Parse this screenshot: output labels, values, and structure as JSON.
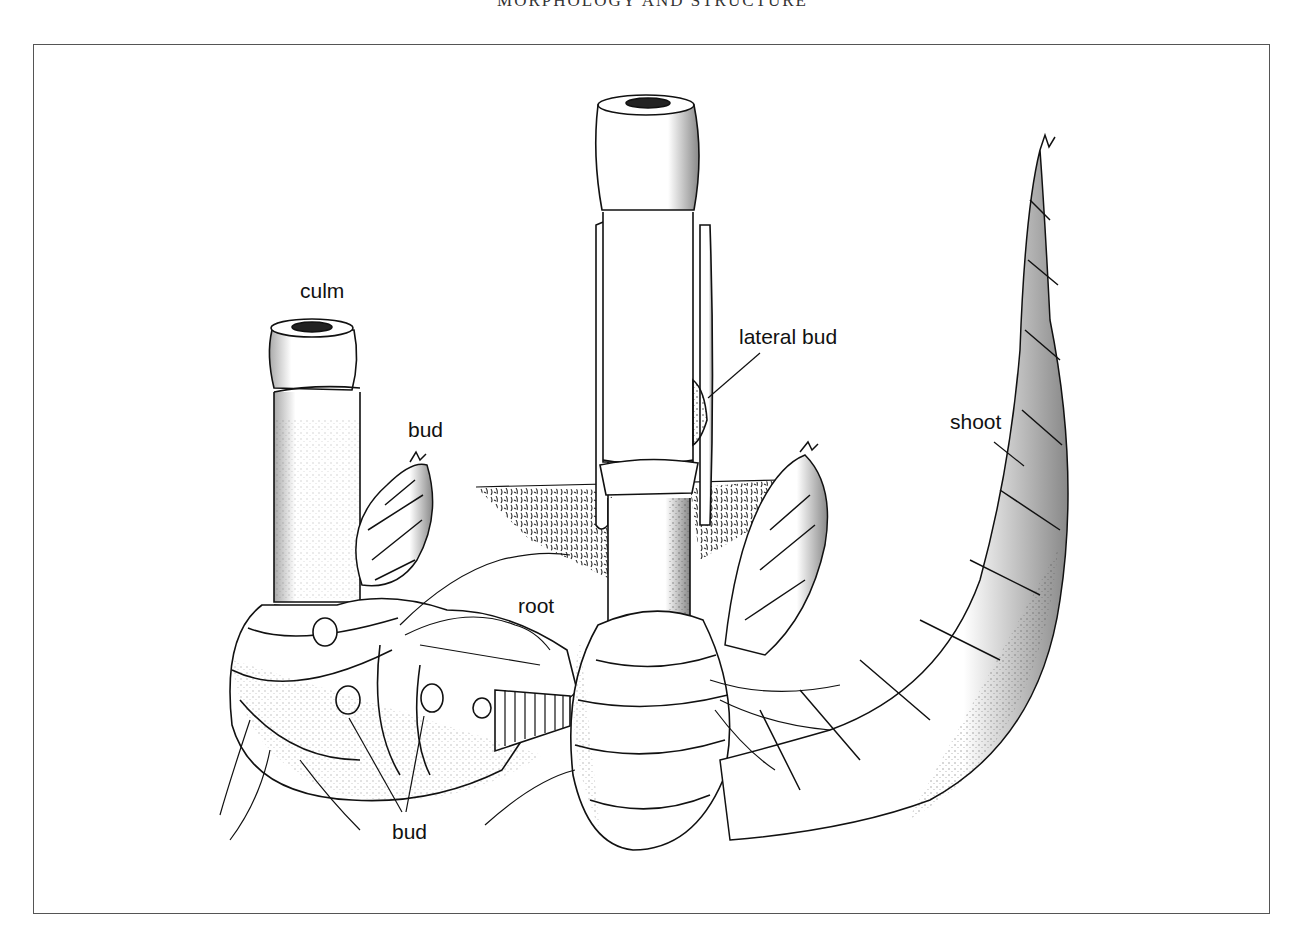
{
  "page": {
    "running_head": "MORPHOLOGY AND STRUCTURE"
  },
  "figure": {
    "labels": [
      {
        "id": "culm",
        "text": "culm"
      },
      {
        "id": "bud-upper",
        "text": "bud"
      },
      {
        "id": "lateral-bud",
        "text": "lateral bud"
      },
      {
        "id": "shoot",
        "text": "shoot"
      },
      {
        "id": "root",
        "text": "root"
      },
      {
        "id": "bud-lower",
        "text": "bud"
      }
    ]
  },
  "colors": {
    "ink": "#111111",
    "paper": "#ffffff",
    "frame": "#555555"
  }
}
